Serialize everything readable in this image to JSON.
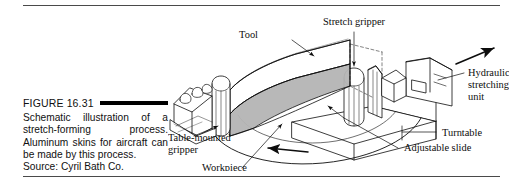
{
  "figure": {
    "number_label": "FIGURE 16.31",
    "caption_text": "Schematic illustration of a stretch-forming process. Aluminum skins for aircraft can be made by this process.",
    "source_label": "Source:",
    "source_name": "Cyril Bath Co."
  },
  "illustration": {
    "title": "stretch-forming machine schematic",
    "labels": {
      "tool": "Tool",
      "stretch_gripper": "Stretch gripper",
      "hydraulic_unit_line1": "Hydraulic",
      "hydraulic_unit_line2": "stretching",
      "hydraulic_unit_line3": "unit",
      "turntable": "Turntable",
      "adjustable_slide": "Adjustable slide",
      "workpiece": "Workpiece",
      "table_gripper_line1": "Table-mounted",
      "table_gripper_line2": "gripper"
    },
    "motion_arrows": {
      "pull_direction": "up-right stretch arrow",
      "rotation_direction": "counter-clockwise turntable arc arrow"
    }
  },
  "colors": {
    "ink": "#0d0d0d",
    "rule": "#4a4a4a",
    "workpiece_fill": "#b4b4b4",
    "tool_fill": "#ffffff",
    "machine_shadow": "#d8d8d8",
    "page_background": "#ffffff"
  }
}
